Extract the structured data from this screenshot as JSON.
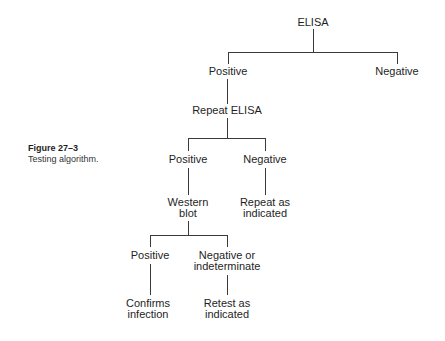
{
  "caption": {
    "figure": "Figure 27–3",
    "description": "Testing algorithm."
  },
  "nodes": {
    "elisa": "ELISA",
    "positive1": "Positive",
    "negative1": "Negative",
    "repeat_elisa": "Repeat ELISA",
    "positive2": "Positive",
    "negative2": "Negative",
    "western_blot": [
      "Western",
      "blot"
    ],
    "repeat_as_indicated": [
      "Repeat as",
      "indicated"
    ],
    "positive3": "Positive",
    "negative_or_indeterminate": [
      "Negative or",
      "indeterminate"
    ],
    "confirms_infection": [
      "Confirms",
      "infection"
    ],
    "retest_as_indicated": [
      "Retest as",
      "indicated"
    ]
  }
}
